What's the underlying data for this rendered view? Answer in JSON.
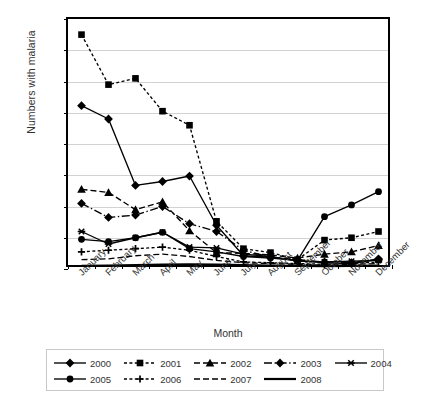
{
  "chart_data": {
    "type": "line",
    "title": "",
    "xlabel": "Month",
    "ylabel": "Numbers with malaria",
    "categories": [
      "January",
      "February",
      "March",
      "April",
      "May",
      "June",
      "July",
      "August",
      "September",
      "October",
      "November",
      "December"
    ],
    "ylim": [
      0,
      1600
    ],
    "ytick_step": 200,
    "ytick_labels": [
      "0",
      "200",
      "400",
      "600",
      "800",
      "1,000",
      "1,200",
      "1,400",
      "1,600"
    ],
    "grid": true,
    "legend_position": "bottom",
    "series": [
      {
        "name": "2000",
        "marker": "diamond",
        "linestyle": "solid",
        "values": [
          1045,
          960,
          535,
          560,
          595,
          280,
          85,
          75,
          55,
          40,
          35,
          60
        ]
      },
      {
        "name": "2001",
        "marker": "square",
        "linestyle": "dotted",
        "values": [
          1500,
          1180,
          1220,
          1010,
          920,
          305,
          130,
          105,
          60,
          185,
          200,
          240
        ]
      },
      {
        "name": "2002",
        "marker": "triangle",
        "linestyle": "dashed",
        "values": [
          510,
          490,
          380,
          430,
          245,
          105,
          100,
          90,
          70,
          95,
          110,
          150
        ]
      },
      {
        "name": "2003",
        "marker": "diamond",
        "linestyle": "dashdot",
        "values": [
          420,
          330,
          345,
          400,
          290,
          240,
          120,
          75,
          60,
          45,
          40,
          65
        ]
      },
      {
        "name": "2004",
        "marker": "star",
        "linestyle": "solid",
        "values": [
          240,
          160,
          200,
          235,
          140,
          135,
          95,
          80,
          50,
          45,
          50,
          55
        ]
      },
      {
        "name": "2005",
        "marker": "circle",
        "linestyle": "solid",
        "values": [
          190,
          175,
          200,
          235,
          130,
          110,
          80,
          70,
          55,
          335,
          410,
          495
        ]
      },
      {
        "name": "2006",
        "marker": "plus",
        "linestyle": "dotted",
        "values": [
          110,
          120,
          130,
          140,
          120,
          80,
          45,
          40,
          35,
          30,
          35,
          45
        ]
      },
      {
        "name": "2007",
        "marker": "none",
        "linestyle": "dashed",
        "values": [
          60,
          65,
          85,
          95,
          80,
          55,
          40,
          35,
          30,
          25,
          30,
          35
        ]
      },
      {
        "name": "2008",
        "marker": "none",
        "linestyle": "solid-thick",
        "values": [
          20,
          22,
          25,
          28,
          30,
          28,
          25,
          22,
          20,
          18,
          20,
          22
        ]
      }
    ]
  },
  "legend": {
    "rows": [
      [
        {
          "label": "2000",
          "marker": "diamond",
          "linestyle": "solid"
        },
        {
          "label": "2001",
          "marker": "square",
          "linestyle": "dotted"
        },
        {
          "label": "2002",
          "marker": "triangle",
          "linestyle": "dashed"
        },
        {
          "label": "2003",
          "marker": "diamond",
          "linestyle": "dashdot"
        },
        {
          "label": "2004",
          "marker": "star",
          "linestyle": "solid"
        }
      ],
      [
        {
          "label": "2005",
          "marker": "circle",
          "linestyle": "solid"
        },
        {
          "label": "2006",
          "marker": "plus",
          "linestyle": "dotted"
        },
        {
          "label": "2007",
          "marker": "none",
          "linestyle": "dashed"
        },
        {
          "label": "2008",
          "marker": "none",
          "linestyle": "solid-thick"
        }
      ]
    ]
  },
  "colors": {
    "ink": "#000000",
    "grid": "#d2d2d2",
    "text": "#333333",
    "legend_border": "#c8c8c8",
    "background": "#ffffff"
  }
}
